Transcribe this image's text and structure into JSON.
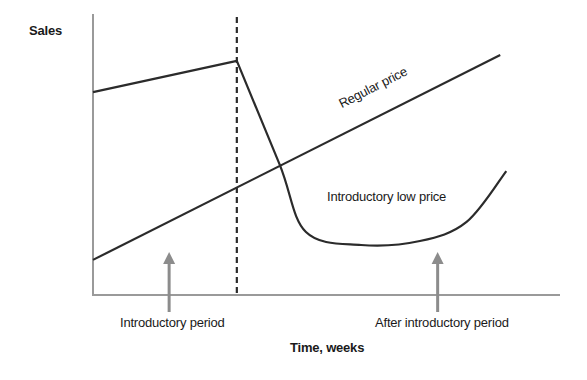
{
  "chart_data": {
    "type": "line",
    "title": "",
    "xlabel": "Time, weeks",
    "ylabel": "Sales",
    "xlim": [
      0,
      100
    ],
    "ylim": [
      0,
      100
    ],
    "grid": false,
    "legend": "none",
    "series": [
      {
        "name": "Regular price",
        "style": "straight",
        "points": [
          [
            0,
            12.5
          ],
          [
            87.2,
            85.4
          ]
        ]
      },
      {
        "name": "Introductory low price",
        "style": "curve",
        "points": [
          [
            0,
            72.2
          ],
          [
            30.8,
            83.3
          ],
          [
            40,
            46.3
          ],
          [
            45.6,
            22.4
          ],
          [
            57.4,
            17.8
          ],
          [
            70,
            19.2
          ],
          [
            80,
            26.0
          ],
          [
            88.5,
            44.1
          ]
        ]
      }
    ],
    "markers": {
      "period_boundary_x": 30.8,
      "arrows": [
        {
          "label": "Introductory period",
          "x": 16.3
        },
        {
          "label": "After introductory period",
          "x": 73.8
        }
      ]
    },
    "annotations": {
      "regular_price": "Regular price",
      "intro_low_price": "Introductory low price",
      "intro_period": "Introductory period",
      "after_period": "After introductory period"
    }
  },
  "colors": {
    "line": "#2b2b2b",
    "axis": "#9a9a9a",
    "arrow": "#8c8c8c"
  }
}
